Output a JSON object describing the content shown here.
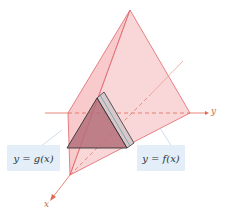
{
  "diagram": {
    "type": "solid-with-triangular-cross-sections",
    "axes": {
      "x_label": "x",
      "y_label": "y"
    },
    "labels": {
      "left_curve": "y = g(x)",
      "right_curve": "y = f(x)"
    },
    "colors": {
      "solid_fill": "#f4a9ad",
      "solid_edge": "#e0656c",
      "cross_section_fill": "#b5707a",
      "axis": "#e06a55",
      "label_bg": "#e3eef8"
    }
  }
}
